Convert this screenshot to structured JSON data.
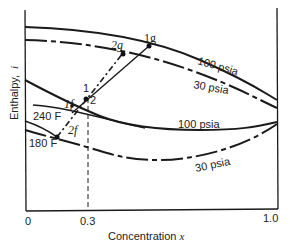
{
  "diagram": {
    "type": "enthalpy-concentration diagram",
    "y_axis": {
      "label": "Enthalpy,",
      "symbol": "i"
    },
    "x_axis": {
      "label": "Concentration",
      "symbol": "x",
      "ticks": [
        "0",
        "0.3",
        "1.0"
      ]
    },
    "curve_labels": {
      "vapor_100": "100 psia",
      "vapor_30": "30 psia",
      "liquid_100": "100 psia",
      "liquid_30": "30 psia",
      "iso_240": "240 F",
      "iso_180": "180 F"
    },
    "points": {
      "p1g": "1g",
      "p2g": "2g",
      "p1": "1",
      "p2": "2",
      "p1f": "1f",
      "p2f": "2f"
    },
    "feed_concentration": "0.3"
  }
}
